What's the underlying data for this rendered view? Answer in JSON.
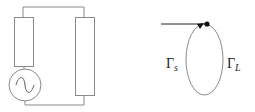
{
  "diagram": {
    "circuit": {
      "source": {
        "type": "ac-voltage-source",
        "symbol": "~"
      },
      "source_impedance": {
        "type": "resistor"
      },
      "load_impedance": {
        "type": "resistor"
      }
    },
    "smith_path": {
      "labels": [
        {
          "id": "gamma_s",
          "base": "Γ",
          "subscript": "s"
        },
        {
          "id": "gamma_L",
          "base": "Γ",
          "subscript": "L"
        }
      ]
    },
    "colors": {
      "stroke": "#8a8a8a",
      "dark": "#111111"
    }
  }
}
